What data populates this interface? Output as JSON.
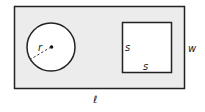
{
  "diagram": {
    "colors": {
      "rectangle_fill": "#ececec",
      "square_fill": "#ffffff",
      "circle_fill": "#ffffff",
      "stroke": "#222222"
    },
    "rectangle": {
      "length_label": "ℓ",
      "width_label": "w"
    },
    "circle": {
      "radius_label": "r"
    },
    "square": {
      "side_left_label": "s",
      "side_bottom_label": "s"
    }
  }
}
